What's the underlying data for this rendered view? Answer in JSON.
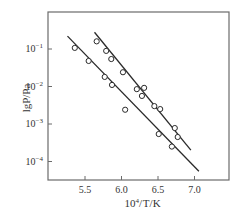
{
  "chart_data": {
    "type": "scatter",
    "title": "",
    "xlabel": "10^4/T/K",
    "ylabel": "lgP/Pa",
    "xlim": [
      5.05,
      7.5
    ],
    "ylim_log10": [
      -4.5,
      0.0
    ],
    "y_scale": "log",
    "grid": false,
    "legend": null,
    "x_ticks": [
      5.5,
      6.0,
      6.5,
      7.0
    ],
    "x_tick_labels": [
      "5.5",
      "6.0",
      "6.5",
      "7.0"
    ],
    "y_ticks_log10": [
      -1,
      -2,
      -3,
      -4
    ],
    "y_tick_labels": [
      "10^-1",
      "10^-2",
      "10^-3",
      "10^-4"
    ],
    "series": [
      {
        "name": "upper series",
        "marker": "open-circle",
        "points": [
          {
            "x": 5.66,
            "y": 0.16
          },
          {
            "x": 5.79,
            "y": 0.089
          },
          {
            "x": 5.86,
            "y": 0.054
          },
          {
            "x": 6.02,
            "y": 0.024
          },
          {
            "x": 6.21,
            "y": 0.0085
          },
          {
            "x": 6.31,
            "y": 0.0092
          },
          {
            "x": 6.28,
            "y": 0.0056
          },
          {
            "x": 6.45,
            "y": 0.003
          },
          {
            "x": 6.53,
            "y": 0.0025
          },
          {
            "x": 6.73,
            "y": 0.00078
          },
          {
            "x": 6.77,
            "y": 0.00045
          }
        ],
        "fit_line": {
          "x0": 5.63,
          "y0": 0.28,
          "x1": 6.95,
          "y1": 0.0002
        }
      },
      {
        "name": "lower series",
        "marker": "open-circle",
        "points": [
          {
            "x": 5.36,
            "y": 0.107
          },
          {
            "x": 5.55,
            "y": 0.048
          },
          {
            "x": 5.77,
            "y": 0.018
          },
          {
            "x": 5.87,
            "y": 0.011
          },
          {
            "x": 6.05,
            "y": 0.0024
          },
          {
            "x": 6.51,
            "y": 0.00054
          },
          {
            "x": 6.69,
            "y": 0.00025
          }
        ],
        "fit_line": {
          "x0": 5.26,
          "y0": 0.22,
          "x1": 7.06,
          "y1": 5.5e-05
        }
      }
    ]
  },
  "colors": {
    "ink": "#2a2a2a",
    "frame": "#6b6b6b",
    "background": "#ffffff"
  }
}
